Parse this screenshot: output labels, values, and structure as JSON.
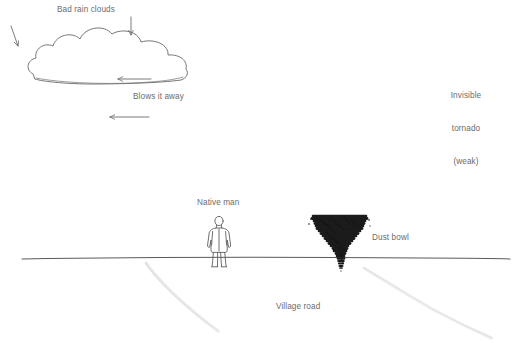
{
  "diagram": {
    "background_color": "#ffffff",
    "ink_color": "#6b6b6b",
    "text_color": "#6b6b6b",
    "tornado_color": "#1c1c1c",
    "width": 531,
    "height": 343
  },
  "labels": {
    "bad_rain_clouds": "Bad rain clouds",
    "blows_it_away": "Blows it away",
    "invisible_tornado": "Invisible\ntornado\n(weak)",
    "invisible_tornado_line1": "Invisible",
    "invisible_tornado_line2": "tornado",
    "invisible_tornado_line3": "(weak)",
    "native_man": "Native man",
    "dust_bowl": "Dust bowl",
    "village_road": "Village road"
  },
  "elements": {
    "cloud": "bad-rain-cloud",
    "man": "native-man-figure",
    "tornado": "dust-bowl-tornado",
    "ground_line": "horizon-ground-line",
    "road_left_edge": "village-road-left-edge",
    "road_right_edge": "village-road-right-edge",
    "arrows": [
      {
        "name": "arrow-down-left",
        "direction": "down"
      },
      {
        "name": "arrow-down-center",
        "direction": "down"
      },
      {
        "name": "arrow-left-upper",
        "direction": "left"
      },
      {
        "name": "arrow-left-lower",
        "direction": "left"
      }
    ]
  }
}
